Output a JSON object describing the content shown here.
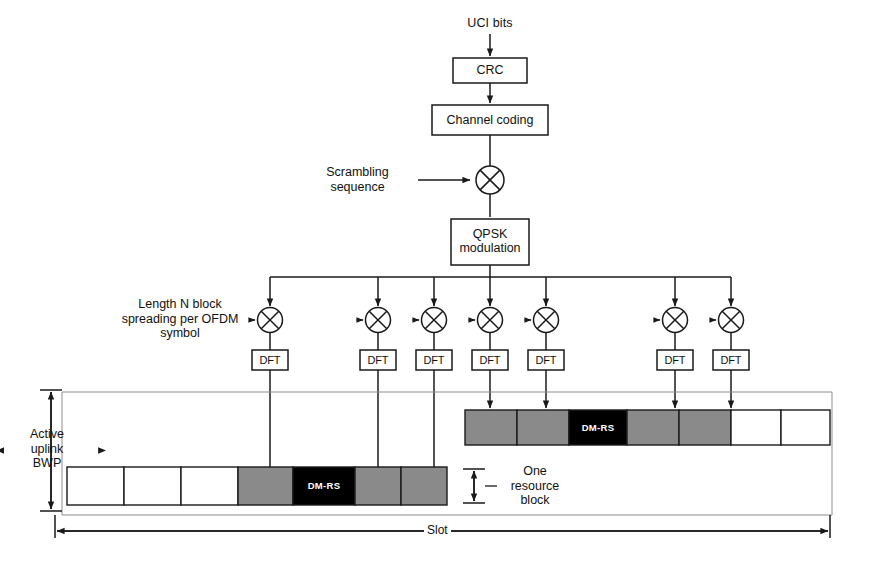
{
  "diagram": {
    "colors": {
      "line": "#1a1a1a",
      "grid_line": "#8d8d8d",
      "gray_cell": "#8a8a8a",
      "dmrs_cell": "#000000",
      "empty_cell": "#ffffff",
      "text": "#111111"
    }
  },
  "chain": {
    "input_label": "UCI bits",
    "blocks": [
      {
        "id": "crc",
        "label": "CRC"
      },
      {
        "id": "channel_coding",
        "label": "Channel coding"
      },
      {
        "id": "qpsk",
        "label": "QPSK\nmodulation"
      }
    ],
    "scrambling_label": "Scrambling\nsequence",
    "scrambling_operator": "multiplier",
    "spreading_label_line1": "Length ",
    "spreading_label_italic": "N",
    "spreading_label_line1b": " block",
    "spreading_label_line2": "spreading per OFDM",
    "spreading_label_line3": "symbol",
    "dft_label": "DFT",
    "branch_count": 7
  },
  "resource_grid": {
    "bwp_label": "Active\nuplink\nBWP",
    "resource_block_label": "One\nresource\nblock",
    "slot_label": "Slot",
    "dmrs_label": "DM-RS",
    "upper_row": [
      {
        "type": "gray"
      },
      {
        "type": "gray"
      },
      {
        "type": "dmrs",
        "label": "DM-RS"
      },
      {
        "type": "gray"
      },
      {
        "type": "gray"
      },
      {
        "type": "empty"
      },
      {
        "type": "empty"
      }
    ],
    "lower_row": [
      {
        "type": "empty"
      },
      {
        "type": "empty"
      },
      {
        "type": "empty"
      },
      {
        "type": "gray"
      },
      {
        "type": "dmrs",
        "label": "DM-RS"
      },
      {
        "type": "gray"
      },
      {
        "type": "gray"
      }
    ]
  }
}
